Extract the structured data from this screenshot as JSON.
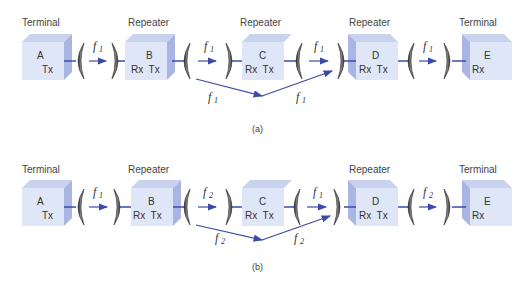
{
  "diagrams": [
    {
      "caption": "(a)",
      "nodes": [
        {
          "role": "Terminal",
          "id": "A",
          "ports": "Tx"
        },
        {
          "role": "Repeater",
          "id": "B",
          "ports": "Rx  Tx"
        },
        {
          "role": "Repeater",
          "id": "C",
          "ports": "Rx  Tx"
        },
        {
          "role": "Repeater",
          "id": "D",
          "ports": "Rx  Tx"
        },
        {
          "role": "Terminal",
          "id": "E",
          "ports": "Rx"
        }
      ],
      "links": [
        {
          "f": "f",
          "sub": "1"
        },
        {
          "f": "f",
          "sub": "1"
        },
        {
          "f": "f",
          "sub": "1"
        },
        {
          "f": "f",
          "sub": "1"
        }
      ],
      "overreach": [
        {
          "f": "f",
          "sub": "1"
        },
        {
          "f": "f",
          "sub": "1"
        }
      ]
    },
    {
      "caption": "(b)",
      "nodes": [
        {
          "role": "Terminal",
          "id": "A",
          "ports": "Tx"
        },
        {
          "role": "Repeater",
          "id": "B",
          "ports": "Rx  Tx"
        },
        {
          "role": "Repeater",
          "id": "C",
          "ports": "Rx  Tx"
        },
        {
          "role": "Repeater",
          "id": "D",
          "ports": "Rx  Tx"
        },
        {
          "role": "Terminal",
          "id": "E",
          "ports": "Rx"
        }
      ],
      "links": [
        {
          "f": "f",
          "sub": "1"
        },
        {
          "f": "f",
          "sub": "2"
        },
        {
          "f": "f",
          "sub": "1"
        },
        {
          "f": "f",
          "sub": "2"
        }
      ],
      "overreach": [
        {
          "f": "f",
          "sub": "2"
        },
        {
          "f": "f",
          "sub": "2"
        }
      ]
    }
  ],
  "colors": {
    "cube_front": "#dfe6f7",
    "cube_top": "#c9d3ee",
    "cube_side": "#a9b6e4",
    "arrow": "#3b4aa8",
    "dish": "#555555"
  }
}
